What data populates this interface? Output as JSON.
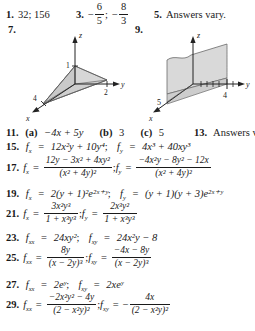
{
  "page": {
    "kind": "textbook-answer-key",
    "background": "#ffffff",
    "ink": "#1a1a1a"
  },
  "top_row": {
    "items": [
      {
        "number": "1.",
        "answer": "32; 156"
      },
      {
        "number": "3.",
        "answer_prefix": "−",
        "frac1_num": "6",
        "frac1_den": "5",
        "sep": ";",
        "answer_mid": "−",
        "frac2_num": "8",
        "frac2_den": "3"
      },
      {
        "number": "5.",
        "answer": "Answers vary."
      }
    ]
  },
  "figures": [
    {
      "number": "7.",
      "name": "tetrahedron-plane-plot",
      "axes": {
        "x": "x",
        "y": "y",
        "z": "z"
      },
      "intercepts": {
        "z": "1",
        "y": "2",
        "x": "4"
      },
      "shade": "#d9d9d9"
    },
    {
      "number": "9.",
      "name": "vertical-plane-plot",
      "axes": {
        "x": "x",
        "y": "y",
        "z": "z"
      },
      "intercepts": {
        "x": "5",
        "y": "4"
      },
      "shade": "#d9d9d9"
    }
  ],
  "answers": {
    "a11": {
      "number": "11.",
      "part_a_label": "(a)",
      "part_a": "−4x + 5y",
      "part_b_label": "(b)",
      "part_b": "3",
      "part_c_label": "(c)",
      "part_c": "5",
      "number13": "13.",
      "answer13": "Answers vary."
    },
    "a15": {
      "number": "15.",
      "fx_name": "f",
      "fx_sub": "x",
      "fx": "12x²y + 10y⁴",
      "fy_sub": "y",
      "fy": "4x³ + 40xy³"
    },
    "a17": {
      "number": "17.",
      "fx_num": "12y − 3x² + 4xy²",
      "fx_den": "(x² + 4y)²",
      "fy_num": "−4x²y − 8y² − 12x",
      "fy_den": "(x² + 4y)²"
    },
    "a19": {
      "number": "19.",
      "fx": "2(y + 1)²e²ˣ⁺ʸ",
      "fy": "(y + 1)(y + 3)e²ˣ⁺ʸ"
    },
    "a21": {
      "number": "21.",
      "fx_num": "3x²y³",
      "fx_den": "1 + x³y³",
      "fy_num": "2x³y²",
      "fy_den": "1 + x³y³"
    },
    "a23": {
      "number": "23.",
      "fxx": "24xy²",
      "fxy": "24x²y − 8"
    },
    "a25": {
      "number": "25.",
      "fxx_num": "8y",
      "fxx_den": "(x − 2y)³",
      "fxy_num": "−4x − 8y",
      "fxy_den": "(x − 2y)³"
    },
    "a27": {
      "number": "27.",
      "fxx": "2eʸ",
      "fxy": "2xeʸ"
    },
    "a29": {
      "number": "29.",
      "fxx_num": "−2x²y² − 4y",
      "fxx_den": "(2 − x²y)²",
      "fxy_sign": "−",
      "fxy_num": "4x",
      "fxy_den": "(2 − x²y)²"
    }
  },
  "symbols": {
    "f": "f",
    "equals": "=",
    "semicolon": ";",
    "sub_x": "x",
    "sub_y": "y",
    "sub_xx": "xx",
    "sub_xy": "xy"
  }
}
